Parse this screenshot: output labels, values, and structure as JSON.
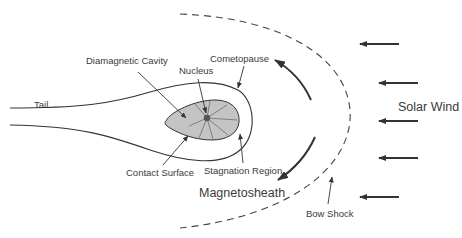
{
  "diagram": {
    "labels": {
      "diamagnetic_cavity": "Diamagnetic Cavity",
      "nucleus": "Nucleus",
      "cometopause": "Cometopause",
      "tail": "Tail",
      "contact_surface": "Contact Surface",
      "stagnation_region": "Stagnation Region",
      "magnetosheath": "Magnetosheath",
      "bow_shock": "Bow Shock",
      "solar_wind": "Solar Wind"
    },
    "solar_wind_arrows": 5,
    "flow_arrows": 2,
    "colors": {
      "line": "#333333",
      "cavity_fill": "#c4c4c4",
      "text": "#3a3a3a",
      "background": "#ffffff"
    }
  }
}
